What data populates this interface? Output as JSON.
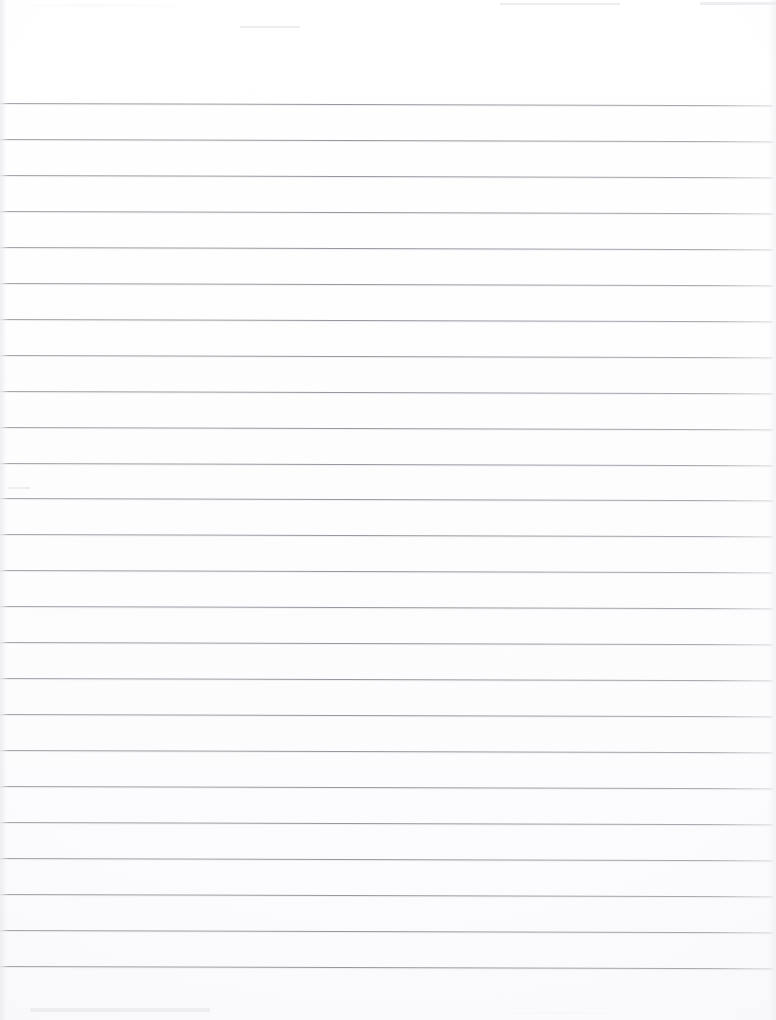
{
  "document": {
    "kind": "scanned-blank-ruled-paper",
    "title": "Blank Ruled Notebook Page",
    "page_width": 776,
    "page_height": 1020,
    "background_color": "#ffffff",
    "rule_color": "#969aa0",
    "rule_thickness_px": 1,
    "rule_spacing_px": 35.9,
    "first_rule_y": 103,
    "last_rule_y": 967,
    "rule_count": 25,
    "rule_left_x": 0,
    "rule_right_x": 773,
    "scan_skew_degrees": 0.16,
    "top_margin_px": 103,
    "bottom_margin_px": 53,
    "has_vertical_margin_line": false,
    "has_handwriting": false,
    "has_printed_text": false,
    "visible_text": ""
  },
  "rules": [
    {
      "index": 1,
      "y": 103.0
    },
    {
      "index": 2,
      "y": 138.9
    },
    {
      "index": 3,
      "y": 174.9
    },
    {
      "index": 4,
      "y": 210.8
    },
    {
      "index": 5,
      "y": 246.8
    },
    {
      "index": 6,
      "y": 282.7
    },
    {
      "index": 7,
      "y": 318.7
    },
    {
      "index": 8,
      "y": 354.6
    },
    {
      "index": 9,
      "y": 390.6
    },
    {
      "index": 10,
      "y": 426.5
    },
    {
      "index": 11,
      "y": 462.5
    },
    {
      "index": 12,
      "y": 498.4
    },
    {
      "index": 13,
      "y": 534.4
    },
    {
      "index": 14,
      "y": 570.3
    },
    {
      "index": 15,
      "y": 606.3
    },
    {
      "index": 16,
      "y": 642.2
    },
    {
      "index": 17,
      "y": 678.2
    },
    {
      "index": 18,
      "y": 714.1
    },
    {
      "index": 19,
      "y": 750.1
    },
    {
      "index": 20,
      "y": 786.0
    },
    {
      "index": 21,
      "y": 822.0
    },
    {
      "index": 22,
      "y": 857.9
    },
    {
      "index": 23,
      "y": 893.9
    },
    {
      "index": 24,
      "y": 929.8
    },
    {
      "index": 25,
      "y": 965.8
    }
  ],
  "scan_artifacts": [
    {
      "name": "top-streak-a",
      "x": 500,
      "y": 3,
      "width": 120,
      "height": 2
    },
    {
      "name": "top-streak-b",
      "x": 700,
      "y": 2,
      "width": 76,
      "height": 3
    },
    {
      "name": "top-streak-c",
      "x": 240,
      "y": 26,
      "width": 60,
      "height": 2
    },
    {
      "name": "mid-streak-a",
      "x": 8,
      "y": 487,
      "width": 22,
      "height": 2
    },
    {
      "name": "bottom-smudge",
      "x": 30,
      "y": 1008,
      "width": 180,
      "height": 4
    }
  ]
}
